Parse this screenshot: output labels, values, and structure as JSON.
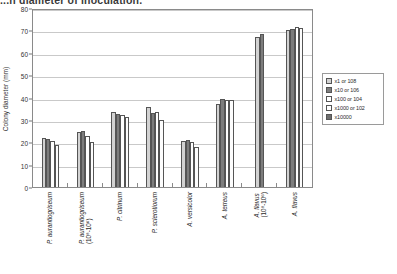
{
  "caption": "...n diameter of inoculation.",
  "chart_data": {
    "type": "bar",
    "title": "",
    "xlabel": "",
    "ylabel": "Colony diameter (mm)",
    "ylim": [
      0,
      80
    ],
    "ytick_step": 10,
    "yticks": [
      "0",
      "10",
      "20",
      "30",
      "40",
      "50",
      "60",
      "70",
      "80"
    ],
    "grid": true,
    "legend_position": "right",
    "categories": [
      "P. aurantiogriseum",
      "P. aurantiogriseum (10⁸-10⁶)",
      "P. citrinum",
      "P. sclerotiorum",
      "A. versicolor",
      "A. terreus",
      "A. flavus (10⁸-10⁶)",
      "A. flavus"
    ],
    "categories_display": [
      {
        "main": "P. aurantiogriseum",
        "sub": ""
      },
      {
        "main": "P. aurantiogriseum",
        "sub": "(10⁸-10⁶)"
      },
      {
        "main": "P. citrinum",
        "sub": ""
      },
      {
        "main": "P. sclerotiorum",
        "sub": ""
      },
      {
        "main": "A. versicolor",
        "sub": ""
      },
      {
        "main": "A. terreus",
        "sub": ""
      },
      {
        "main": "A. flavus",
        "sub": "(10⁸-10⁶)"
      },
      {
        "main": "A. flavus",
        "sub": ""
      }
    ],
    "series": [
      {
        "name": "x1 or 108",
        "values": [
          22.0,
          24.5,
          33.5,
          36.0,
          20.5,
          37.0,
          67.0,
          70.0
        ]
      },
      {
        "name": "x10 or 106",
        "values": [
          21.5,
          25.0,
          32.5,
          33.0,
          21.0,
          39.5,
          68.5,
          70.5
        ]
      },
      {
        "name": "x100 or 104",
        "values": [
          20.5,
          23.0,
          32.0,
          33.5,
          20.0,
          39.0,
          null,
          71.5
        ]
      },
      {
        "name": "x1000 or 102",
        "values": [
          19.0,
          20.0,
          31.5,
          30.0,
          18.0,
          39.0,
          null,
          71.0
        ]
      },
      {
        "name": "x10000",
        "values": [
          null,
          null,
          null,
          null,
          null,
          null,
          null,
          null
        ]
      }
    ],
    "legend_entries": [
      "x1 or 108",
      "x10 or 106",
      "x100 or 104",
      "x1000 or 102",
      "x10000"
    ]
  }
}
